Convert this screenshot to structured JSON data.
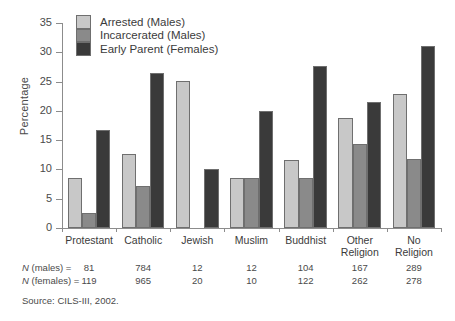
{
  "chart_data": {
    "type": "bar",
    "title": "",
    "xlabel": "",
    "ylabel": "Percentage",
    "ylim": [
      0,
      35
    ],
    "yticks": [
      0,
      5,
      10,
      15,
      20,
      25,
      30,
      35
    ],
    "grid": false,
    "legend_position": "top-left",
    "categories": [
      "Protestant",
      "Catholic",
      "Jewish",
      "Muslim",
      "Buddhist",
      "Other Religion",
      "No Religion"
    ],
    "category_lines": [
      [
        "Protestant"
      ],
      [
        "Catholic"
      ],
      [
        "Jewish"
      ],
      [
        "Muslim"
      ],
      [
        "Buddhist"
      ],
      [
        "Other",
        "Religion"
      ],
      [
        "No",
        "Religion"
      ]
    ],
    "series": [
      {
        "name": "Arrested (Males)",
        "color": "#c8c8c8",
        "values": [
          8.5,
          12.7,
          25.1,
          8.5,
          11.6,
          18.7,
          22.9
        ]
      },
      {
        "name": "Incarcerated (Males)",
        "color": "#8a8a8a",
        "values": [
          2.6,
          7.2,
          0,
          8.5,
          8.6,
          14.4,
          11.7
        ]
      },
      {
        "name": "Early Parent (Females)",
        "color": "#3a3a3a",
        "values": [
          16.8,
          26.5,
          10.0,
          20.0,
          27.6,
          21.5,
          31.1
        ]
      }
    ]
  },
  "ntable": {
    "rows": [
      {
        "label_italic": "N",
        "label_rest": " (males) =",
        "values": [
          "81",
          "784",
          "12",
          "12",
          "104",
          "167",
          "289"
        ]
      },
      {
        "label_italic": "N",
        "label_rest": " (females) =",
        "values": [
          "119",
          "965",
          "20",
          "10",
          "122",
          "262",
          "278"
        ]
      }
    ]
  },
  "source": "Source: CILS-III, 2002."
}
